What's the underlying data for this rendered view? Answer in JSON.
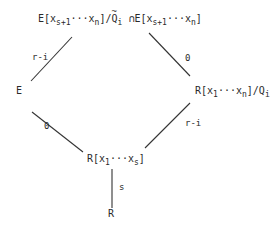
{
  "diagram": {
    "type": "lattice-diagram",
    "nodes": {
      "top": {
        "left_part": {
          "prefix": "E[x",
          "sub1": "s+1",
          "dots": "···x",
          "sub2": "n",
          "suffix": "]/",
          "Q": "Q",
          "Q_sub": "i",
          "Q_accent": "~"
        },
        "cap": "∩",
        "right_part": {
          "prefix": "E[x",
          "sub1": "s+1",
          "dots": "···x",
          "sub2": "n",
          "suffix": "]"
        },
        "full_text": "E[x_{s+1}···x_n]/Q̃_i ∩ E[x_{s+1}···x_n]"
      },
      "left": {
        "text": "E"
      },
      "right": {
        "prefix": "R[x",
        "sub1": "1",
        "dots": "···x",
        "sub2": "n",
        "suffix": "]/Q",
        "sub3": "i",
        "full_text": "R[x_1···x_n]/Q_i"
      },
      "middle": {
        "prefix": "R[x",
        "sub1": "1",
        "dots": "···x",
        "sub2": "s",
        "suffix": "]",
        "full_text": "R[x_1···x_s]"
      },
      "bottom": {
        "text": "R"
      }
    },
    "edges": [
      {
        "from": "left",
        "to": "top",
        "label": "r-i"
      },
      {
        "from": "right",
        "to": "top",
        "label": "0"
      },
      {
        "from": "middle",
        "to": "left",
        "label": "0"
      },
      {
        "from": "middle",
        "to": "right",
        "label": "r-i"
      },
      {
        "from": "bottom",
        "to": "middle",
        "label": "s"
      }
    ]
  }
}
